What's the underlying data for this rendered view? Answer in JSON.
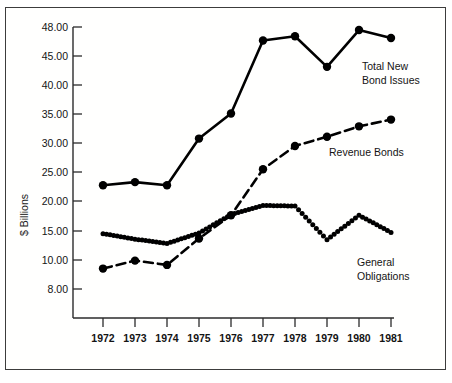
{
  "chart_data": {
    "type": "line",
    "title": "",
    "xlabel": "",
    "ylabel": "$ Billions",
    "categories": [
      "1972",
      "1973",
      "1974",
      "1975",
      "1976",
      "1977",
      "1978",
      "1979",
      "1980",
      "1981"
    ],
    "x": [
      1972,
      1973,
      1974,
      1975,
      1976,
      1977,
      1978,
      1979,
      1980,
      1981
    ],
    "ylim": [
      8.0,
      48.0
    ],
    "ytick_labels": [
      "48.00",
      "45.00",
      "40.00",
      "35.00",
      "30.00",
      "25.00",
      "20.00",
      "15.00",
      "10.00",
      "8.00"
    ],
    "ytick_values": [
      48.0,
      45.0,
      40.0,
      35.0,
      30.0,
      25.0,
      20.0,
      15.0,
      10.0,
      8.0
    ],
    "grid": false,
    "legend_position": "inline-annotations",
    "series": [
      {
        "name": "Total New Bond Issues",
        "style": "solid",
        "marker": "filled-circle",
        "values": [
          22.2,
          22.7,
          22.2,
          29.8,
          33.9,
          45.8,
          46.5,
          41.5,
          47.5,
          46.2
        ],
        "annotation": "Total New Bond Issues"
      },
      {
        "name": "Revenue Bonds",
        "style": "dashed",
        "marker": "filled-circle",
        "values": [
          8.6,
          9.9,
          9.2,
          13.5,
          17.3,
          24.8,
          28.6,
          30.1,
          31.8,
          32.9
        ],
        "annotation": "Revenue Bonds"
      },
      {
        "name": "General Obligations",
        "style": "dotted",
        "marker": "small-filled-circle",
        "values": [
          14.3,
          13.4,
          12.7,
          14.4,
          17.4,
          18.9,
          18.8,
          13.3,
          17.3,
          14.5
        ],
        "annotation": "General Obligations"
      }
    ],
    "annotations": [
      {
        "text_line1": "Total New",
        "text_line2": "Bond Issues"
      },
      {
        "text_line1": "Revenue Bonds",
        "text_line2": ""
      },
      {
        "text_line1": "General",
        "text_line2": "Obligations"
      }
    ]
  },
  "colors": {
    "line": "#000000",
    "frame": "#3c3c3c",
    "text": "#141414",
    "background": "#ffffff"
  },
  "labels": {
    "y_axis_title": "$ Billions",
    "series_total_line1": "Total New",
    "series_total_line2": "Bond Issues",
    "series_revenue": "Revenue Bonds",
    "series_go_line1": "General",
    "series_go_line2": "Obligations",
    "ytick_0": "48.00",
    "ytick_1": "45.00",
    "ytick_2": "40.00",
    "ytick_3": "35.00",
    "ytick_4": "30.00",
    "ytick_5": "25.00",
    "ytick_6": "20.00",
    "ytick_7": "15.00",
    "ytick_8": "10.00",
    "ytick_9": "8.00",
    "xtick_0": "1972",
    "xtick_1": "1973",
    "xtick_2": "1974",
    "xtick_3": "1975",
    "xtick_4": "1976",
    "xtick_5": "1977",
    "xtick_6": "1978",
    "xtick_7": "1979",
    "xtick_8": "1980",
    "xtick_9": "1981"
  }
}
